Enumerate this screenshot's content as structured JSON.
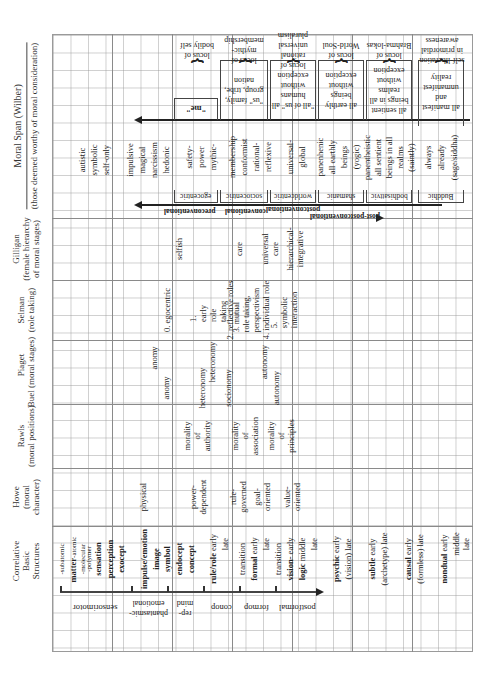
{
  "headers": {
    "moral_span": {
      "title": "Moral Span (Wilber)",
      "subtitle": "(those deemed worthy of moral consideration)"
    },
    "gilligan": {
      "title": "Gilligan",
      "subtitle1": "(female hierarchy",
      "subtitle2": "of moral stages)"
    },
    "selman": {
      "title": "Selman",
      "subtitle": "(role taking)"
    },
    "piaget": {
      "title": "Piaget"
    },
    "buel": {
      "title": "Buel",
      "subtitle": "(moral stages)"
    },
    "rawls": {
      "title": "Rawls",
      "subtitle": "(moral positions)"
    },
    "howe": {
      "title": "Howe",
      "subtitle1": "(moral",
      "subtitle2": "character)"
    },
    "structures": {
      "title1": "Correlative",
      "title2": "Basic",
      "title3": "Structures"
    }
  },
  "structures": {
    "items": [
      {
        "label": "-subatomic",
        "bold": false
      },
      {
        "label": "matter",
        "suffix": "-atomic",
        "bold": true
      },
      {
        "label": "-molecular",
        "bold": false
      },
      {
        "label": "-polymer",
        "bold": false
      },
      {
        "label": "sensation",
        "bold": true
      },
      {
        "label": "perception",
        "bold": true
      },
      {
        "label": "exocept",
        "bold": true
      },
      {
        "label": "impulse/emotion",
        "bold": true
      },
      {
        "label": "image",
        "bold": true
      },
      {
        "label": "symbol",
        "bold": true
      },
      {
        "label": "endocept",
        "bold": true
      },
      {
        "label": "concept",
        "bold": true
      },
      {
        "label": "rule/role",
        "suffix": "early",
        "bold": true
      },
      {
        "label": "late",
        "bold": false
      },
      {
        "label": "transition",
        "bold": false
      },
      {
        "label": "formal",
        "suffix": "early",
        "bold": true
      },
      {
        "label": "late",
        "bold": false
      },
      {
        "label": "transition",
        "bold": false
      },
      {
        "label": "vision-",
        "suffix": "early",
        "bold": true
      },
      {
        "label": "logic",
        "suffix": "middle",
        "bold": true
      },
      {
        "label": "late",
        "bold": false
      },
      {
        "label": "psychic",
        "suffix": "early",
        "bold": true
      },
      {
        "label": "(vision)",
        "suffix": "late",
        "bold": false
      },
      {
        "label": "subtle",
        "suffix": "early",
        "bold": true
      },
      {
        "label": "(archetype)",
        "suffix": "late",
        "bold": false
      },
      {
        "label": "causal",
        "suffix": "early",
        "bold": true
      },
      {
        "label": "(formless)",
        "suffix": "late",
        "bold": false
      },
      {
        "label": "nondual",
        "suffix": "early",
        "bold": true
      },
      {
        "label": "middle",
        "bold": false
      },
      {
        "label": "late",
        "bold": false
      }
    ],
    "bands": [
      "sensorimotor",
      "phantasmic-emotional",
      "rep-mind",
      "conop",
      "formop",
      "postformal"
    ]
  },
  "howe": [
    "physical",
    "power-dependent",
    "rule-governed",
    "goal-oriented",
    "value-oriented"
  ],
  "rawls": [
    "morality of authority",
    "morality of association",
    "morality of principles"
  ],
  "buel": [
    "anomy",
    "heteronomy",
    "socionomy",
    "autonomy"
  ],
  "piaget": [
    "anomy",
    "heteronomy",
    "autonomy"
  ],
  "selman": [
    "0. egocentric",
    "1. early role taking",
    "2. reflective roles",
    "3. mutual role taking, perspectivism",
    "4. individual role",
    "5. symbolic interaction"
  ],
  "gilligan": [
    "selfish",
    "care",
    "universal care",
    "hierarchical-integrative"
  ],
  "moral_span": {
    "early_stages": [
      "autistic",
      "symbolic",
      "self-only",
      "impulsive",
      "magical",
      "narcissism",
      "hedonic"
    ],
    "stages": [
      {
        "desc": "safety- power mythic-",
        "level": "egocentric",
        "span": "\"me\"",
        "focus": "locus of bodily self"
      },
      {
        "desc": "membership conformist rational- reflexive",
        "level": "sociocentric",
        "span": "\"us\" family, group, tribe, nation",
        "focus": "locus of mythic-membership"
      },
      {
        "desc": "universal- global",
        "level": "worldcentric",
        "span": "\"all of us\" all humans without exception",
        "focus": "locus of rational universal pluralism"
      },
      {
        "desc": "panenhenic all earthly beings (yogic)",
        "level": "shamanic",
        "span": "all earthly beings without exception",
        "focus": "locus of World-Soul"
      },
      {
        "desc": "panentheistic all sentient beings in all realms (saintly)",
        "level": "bodhisattvic",
        "span": "all sentient beings in all realms without exception",
        "focus": "locus of Brahma-lokas"
      },
      {
        "desc": "always already (sage/siddha)",
        "level": "Buddhic",
        "span": "all manifest and unmanifest reality",
        "focus": "self-liberation in primordial awareness"
      }
    ],
    "phases": [
      "preconventional",
      "conventional",
      "postconventional",
      "post-postconventional"
    ]
  }
}
